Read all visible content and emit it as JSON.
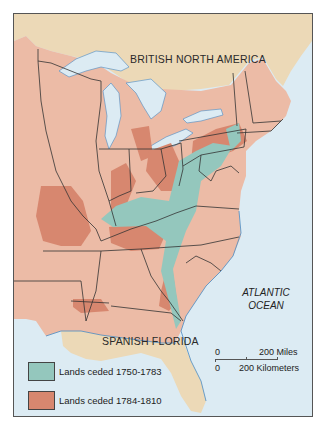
{
  "map": {
    "labels": {
      "north": "BRITISH NORTH AMERICA",
      "south": "SPANISH FLORIDA",
      "ocean_line1": "ATLANTIC",
      "ocean_line2": "OCEAN"
    },
    "legend": [
      {
        "label": "Lands ceded 1750-1783",
        "color": "#94c7bd"
      },
      {
        "label": "Lands ceded 1784-1810",
        "color": "#d7876f"
      }
    ],
    "scale": {
      "miles_zero": "0",
      "miles_label": "200 Miles",
      "km_zero": "0",
      "km_label": "200 Kilometers"
    },
    "colors": {
      "water": "#dcebf3",
      "british_territory": "#ecd9b7",
      "us_territory": "#ecbba6",
      "ceded_1750_1783": "#94c7bd",
      "ceded_1784_1810": "#d7876f",
      "border": "#333333",
      "coast": "#4a8ac2"
    }
  }
}
